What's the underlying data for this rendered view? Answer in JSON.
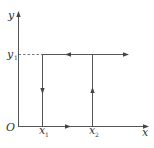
{
  "diagram": {
    "type": "path-on-axes",
    "axes": {
      "x_label": "x",
      "y_label": "y",
      "origin_label": "O"
    },
    "ticks": {
      "x1": {
        "base": "x",
        "sub": "1"
      },
      "x2": {
        "base": "x",
        "sub": "2"
      },
      "y1": {
        "base": "y",
        "sub": "1"
      }
    },
    "segments": [
      {
        "from": "O",
        "to": "x-axis end",
        "direction": "right",
        "desc": "arrow on x-axis between x1 and x2 pointing right"
      },
      {
        "from": "(x2,0)",
        "to": "(x2,y1)",
        "direction": "up"
      },
      {
        "from": "(x2,y1)",
        "to": "(x1,y1)",
        "direction": "left"
      },
      {
        "from": "(x2,y1)",
        "to": "right",
        "direction": "right"
      },
      {
        "from": "(x1,y1)",
        "to": "(x1,0)",
        "direction": "down"
      },
      {
        "from": "(0,y1)",
        "to": "(x1,y1)",
        "style": "dashed"
      }
    ],
    "colors": {
      "line": "#555555",
      "text": "#333333"
    }
  }
}
